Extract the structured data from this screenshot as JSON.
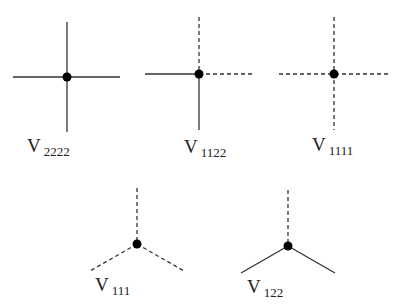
{
  "diagram": {
    "line_styles": {
      "1": "dashed",
      "2": "solid"
    },
    "vertices": [
      {
        "id": "v2222",
        "label_main": "V",
        "label_sub": "2222",
        "legs": [
          "solid",
          "solid",
          "solid",
          "solid"
        ]
      },
      {
        "id": "v1122",
        "label_main": "V",
        "label_sub": "1122",
        "legs": [
          "dashed",
          "dashed",
          "solid",
          "solid"
        ]
      },
      {
        "id": "v1111",
        "label_main": "V",
        "label_sub": "1111",
        "legs": [
          "dashed",
          "dashed",
          "dashed",
          "dashed"
        ]
      },
      {
        "id": "v111",
        "label_main": "V",
        "label_sub": "111",
        "legs": [
          "dashed",
          "dashed",
          "dashed"
        ]
      },
      {
        "id": "v122",
        "label_main": "V",
        "label_sub": "122",
        "legs": [
          "dashed",
          "solid",
          "solid"
        ]
      }
    ],
    "colors": {
      "line": "#333333",
      "dot": "#000000",
      "background": "#ffffff"
    }
  }
}
